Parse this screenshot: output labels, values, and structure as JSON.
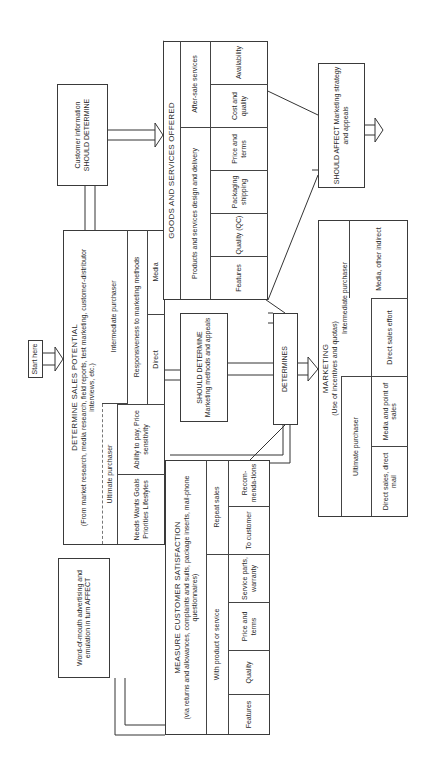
{
  "orientation": "rotated-90-ccw",
  "start": {
    "label": "Start here"
  },
  "determine_sales": {
    "title": "DETERMINE SALES POTENTIAL",
    "subtitle": "(From market research, media research, field reports, test marketing, customer-distributor interviews, etc.)",
    "ultimate": {
      "label": "Ultimate purchaser",
      "cells": [
        "Needs Wants Goals Priorities Lifestyles",
        "Ability to pay, Price sensitivity"
      ]
    },
    "intermediate": {
      "label": "Intermediate purchaser",
      "responsiveness": "Responsiveness to marketing methods",
      "cells": [
        "Direct",
        "Media"
      ]
    }
  },
  "customer_info": {
    "label": "Customer information SHOULD DETERMINE"
  },
  "goods": {
    "title": "GOODS AND SERVICES OFFERED",
    "products": {
      "label": "Products and services design and delivery",
      "cells": [
        "Features",
        "Quality (QC)",
        "Packaging shipping",
        "Price and terms"
      ]
    },
    "after_sale": {
      "label": "After-sale services",
      "cells": [
        "Cost and quality",
        "Availability"
      ]
    }
  },
  "should_affect": {
    "label": "SHOULD AFFECT Marketing strategy and appeals"
  },
  "should_determine": {
    "label": "SHOULD DETERMINE Marketing methods and appeals"
  },
  "determines": {
    "label": "DETERMINES"
  },
  "marketing": {
    "title": "MARKETING",
    "subtitle": "(Use of incentives and quotas)",
    "ultimate": {
      "label": "Ultimate purchaser",
      "cells": [
        "Direct sales, direct mail",
        "Media and point of sales"
      ]
    },
    "intermediate": {
      "label": "Intermediate purchaser",
      "cells": [
        "Direct sales effort",
        "Media, other indirect"
      ]
    }
  },
  "word_of_mouth": {
    "label": "Word-of-mouth advertising and emulation in turn AFFECT"
  },
  "measure": {
    "title": "MEASURE CUSTOMER SATISFACTION",
    "subtitle": "(via returns and allowances, complaints and suits, package inserts, mail-phone questionnaires)",
    "with_product": {
      "label": "With product or service",
      "cells": [
        "Features",
        "Quality",
        "Price and terms",
        "Service parts, warranty"
      ]
    },
    "repeat_sales": {
      "label": "Repeat sales",
      "cells": [
        "To customer",
        "Recom-menda-tions"
      ]
    }
  }
}
